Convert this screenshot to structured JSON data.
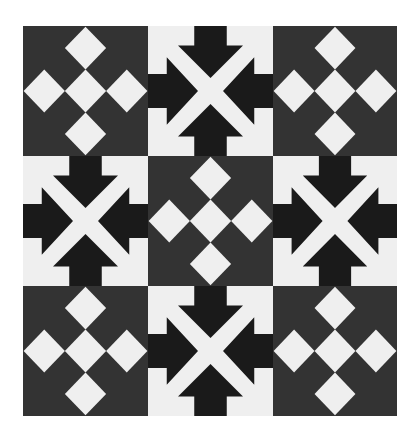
{
  "image": {
    "title": "Geometric tile pattern",
    "description": "3x3 checkerboard of two alternating tile designs: diamond-cross tiles and inward-arrow tiles"
  },
  "colors": {
    "diamond_tile_background": "#333333",
    "diamond_fill": "#efefef",
    "arrow_tile_background": "#efefef",
    "arrow_fill": "#1a1a1a",
    "page_background": "#ffffff"
  },
  "grid": {
    "rows": 3,
    "columns": 3,
    "tiles": [
      {
        "row": 1,
        "col": 1,
        "type": "diamond-cross"
      },
      {
        "row": 1,
        "col": 2,
        "type": "inward-arrows"
      },
      {
        "row": 1,
        "col": 3,
        "type": "diamond-cross"
      },
      {
        "row": 2,
        "col": 1,
        "type": "inward-arrows"
      },
      {
        "row": 2,
        "col": 2,
        "type": "diamond-cross"
      },
      {
        "row": 2,
        "col": 3,
        "type": "inward-arrows"
      },
      {
        "row": 3,
        "col": 1,
        "type": "diamond-cross"
      },
      {
        "row": 3,
        "col": 2,
        "type": "inward-arrows"
      },
      {
        "row": 3,
        "col": 3,
        "type": "diamond-cross"
      }
    ]
  },
  "motifs": {
    "diamond_cross": {
      "diamond_count": 5,
      "diamond_centers_pct": [
        [
          50,
          17
        ],
        [
          17,
          50
        ],
        [
          50,
          50
        ],
        [
          83,
          50
        ],
        [
          50,
          83
        ]
      ],
      "diamond_half_size_pct": 16.5
    },
    "inward_arrows": {
      "arrow_count": 4,
      "directions": [
        "down",
        "right",
        "left",
        "up"
      ]
    }
  }
}
